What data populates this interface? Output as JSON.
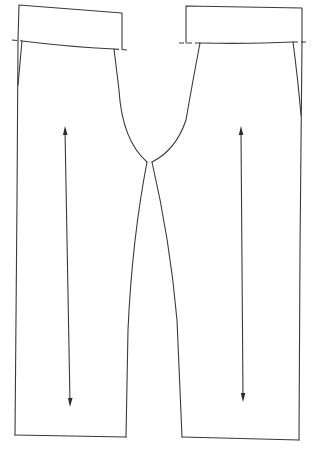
{
  "diagram": {
    "type": "sewing-pattern",
    "line_color": "#3a3a3a",
    "background": "#ffffff",
    "pieces": [
      {
        "name": "left-leg-piece",
        "waistband": {
          "top_left": [
            19,
            5
          ],
          "top_right": [
            122,
            13
          ]
        },
        "waistline": {
          "start": [
            22,
            41
          ],
          "end": [
            114,
            49
          ]
        },
        "waistline_extension": {
          "start": [
            13,
            40
          ],
          "end": [
            127,
            50
          ]
        },
        "hem": {
          "start": [
            15,
            435
          ],
          "end": [
            126,
            437
          ]
        },
        "crotch_point": [
          147,
          162
        ],
        "grainline_arrow": {
          "x_top": 65,
          "y_top": 128,
          "x_bottom": 68,
          "y_bottom": 405
        }
      },
      {
        "name": "right-leg-piece",
        "waistband": {
          "top_left": [
            186,
            6
          ],
          "top_right": [
            302,
            8
          ]
        },
        "waistline": {
          "start": [
            200,
            43
          ],
          "end": [
            293,
            42
          ]
        },
        "waistline_extension": {
          "start": [
            180,
            43
          ],
          "end": [
            306,
            42
          ]
        },
        "hem": {
          "start": [
            182,
            437
          ],
          "end": [
            299,
            440
          ]
        },
        "crotch_point": [
          152,
          162
        ],
        "grainline_arrow": {
          "x_top": 241,
          "y_top": 130,
          "x_bottom": 242,
          "y_bottom": 400
        }
      }
    ]
  }
}
